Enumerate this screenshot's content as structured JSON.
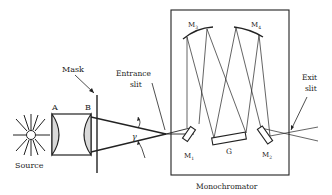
{
  "diagram": {
    "type": "monochromator-optical-layout",
    "colors": {
      "ink": "#222222",
      "lens_fill": "#d9d9d9",
      "background": "#ffffff"
    },
    "labels": {
      "source": "Source",
      "lens_a": "A",
      "lens_b": "B",
      "mask": "Mask",
      "entrance_slit_line1": "Entrance",
      "entrance_slit_line2": "slit",
      "angle": "γ",
      "m1": "M",
      "m1_sub": "1",
      "m2": "M",
      "m2_sub": "2",
      "m3": "M",
      "m3_sub": "3",
      "m4": "M",
      "m4_sub": "4",
      "grating": "G",
      "exit_slit_line1": "Exit",
      "exit_slit_line2": "slit",
      "monochromator": "Monochromator"
    }
  }
}
